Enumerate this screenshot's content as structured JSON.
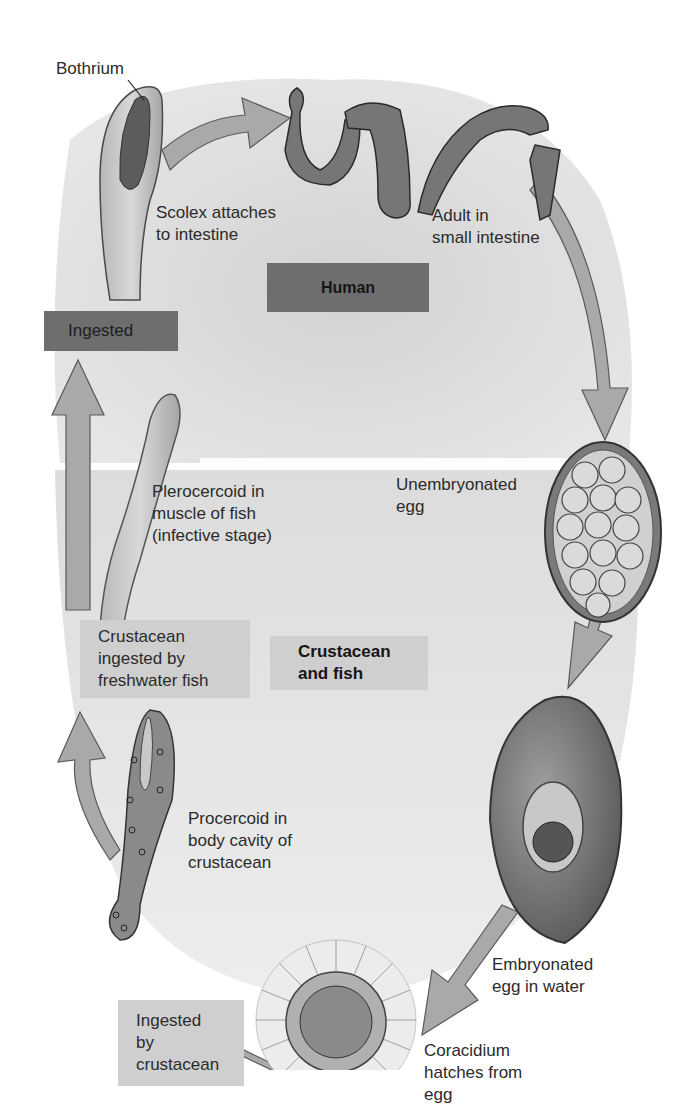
{
  "hosts": {
    "human": "Human",
    "crustacean_fish": [
      "Crustacean",
      "and fish"
    ]
  },
  "labels": {
    "bothrium": "Bothrium",
    "scolex": [
      "Scolex attaches",
      "to intestine"
    ],
    "adult": [
      "Adult in",
      "small intestine"
    ],
    "ingested": "Ingested",
    "plerocercoid": [
      "Plerocercoid in",
      "muscle of fish",
      "(infective stage)"
    ],
    "unembryonated": [
      "Unembryonated",
      "egg"
    ],
    "crustacean_ingested": [
      "Crustacean",
      "ingested by",
      "freshwater fish"
    ],
    "procercoid": [
      "Procercoid in",
      "body cavity of",
      "crustacean"
    ],
    "embryonated": [
      "Embryonated",
      "egg in water"
    ],
    "ingested_by_crustacean": [
      "Ingested",
      "by",
      "crustacean"
    ],
    "coracidium": [
      "Coracidium",
      "hatches from",
      "egg"
    ]
  },
  "stages": [
    "Scolex attaches to intestine",
    "Adult in small intestine",
    "Unembryonated egg",
    "Embryonated egg in water",
    "Coracidium hatches from egg",
    "Ingested by crustacean",
    "Procercoid in body cavity of crustacean",
    "Crustacean ingested by freshwater fish",
    "Plerocercoid in muscle of fish (infective stage)",
    "Ingested"
  ],
  "colors": {
    "background_human": "#d9d9d9",
    "background_crustacean": "#e3e3e3",
    "arrow_fill": "#a9a9a9",
    "arrow_stroke": "#5a5a5a",
    "box_dark": "#6e6e6e",
    "box_light": "#cfcfcf",
    "worm_fill": "#7a7a7a"
  }
}
